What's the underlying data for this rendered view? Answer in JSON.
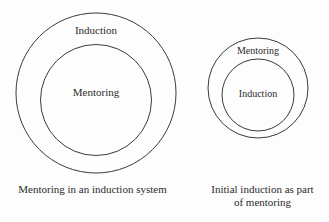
{
  "page": {
    "background_color": "#fdfdfd",
    "stroke_color": "#3a3a3a",
    "text_color": "#2b2b2b",
    "top_artifact_text": "."
  },
  "diagrams": [
    {
      "id": "mentoring-in-induction",
      "outer_label": "Induction",
      "inner_label": "Mentoring",
      "caption": "Mentoring in an induction system"
    },
    {
      "id": "initial-induction-in-mentoring",
      "outer_label": "Mentoring",
      "inner_label": "Induction",
      "caption": "Initial induction as part\nof mentoring"
    }
  ]
}
